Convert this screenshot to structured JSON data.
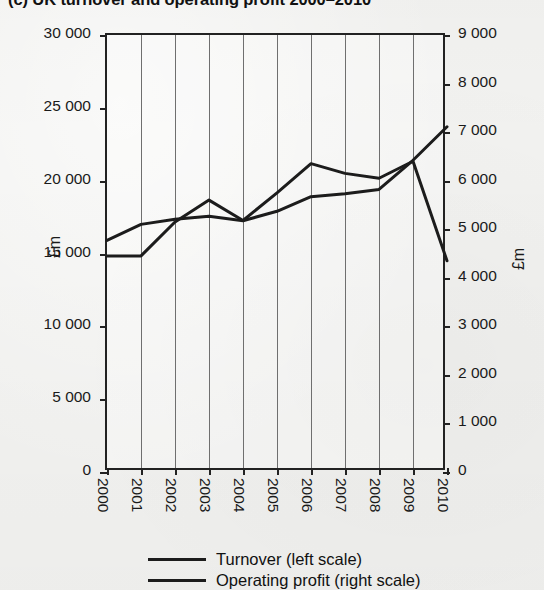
{
  "chart_data": {
    "type": "line",
    "title": "(c) UK turnover and operating profit 2000–2010",
    "xlabel": "",
    "ylabel": "£m",
    "ylabel_right": "£m",
    "categories": [
      "2000",
      "2001",
      "2002",
      "2003",
      "2004",
      "2005",
      "2006",
      "2007",
      "2008",
      "2009",
      "2010"
    ],
    "x_tick_labels": [
      "2000",
      "2001",
      "2002",
      "2003",
      "2004",
      "2005",
      "2006",
      "2007",
      "2008",
      "2009",
      "2010"
    ],
    "y_tick_labels_left": [
      "0",
      "5 000",
      "10 000",
      "15 000",
      "20 000",
      "25 000",
      "30 000"
    ],
    "y_tick_values_left": [
      0,
      5000,
      10000,
      15000,
      20000,
      25000,
      30000
    ],
    "y_tick_labels_right": [
      "0",
      "1 000",
      "2 000",
      "3 000",
      "4 000",
      "5 000",
      "6 000",
      "7 000",
      "8 000",
      "9 000"
    ],
    "y_tick_values_right": [
      0,
      1000,
      2000,
      3000,
      4000,
      5000,
      6000,
      7000,
      8000,
      9000
    ],
    "ylim_left": [
      0,
      30000
    ],
    "ylim_right": [
      0,
      9000
    ],
    "grid": true,
    "grid_axis": "x",
    "legend_position": "bottom",
    "series": [
      {
        "name": "Turnover (left scale)",
        "axis": "left",
        "color": "#1c1c1c",
        "values": [
          15900,
          17000,
          17350,
          17550,
          17250,
          17900,
          18900,
          19100,
          19400,
          21400,
          23700
        ]
      },
      {
        "name": "Operating profit (right scale)",
        "axis": "right",
        "color": "#1c1c1c",
        "values": [
          4450,
          4450,
          5150,
          5600,
          5180,
          5750,
          6350,
          6150,
          6050,
          6400,
          4350
        ]
      }
    ]
  },
  "legend": {
    "items": [
      {
        "label": "Turnover (left scale)"
      },
      {
        "label": "Operating profit (right scale)"
      }
    ]
  },
  "axes": {
    "left_title": "£m",
    "right_title": "£m"
  }
}
